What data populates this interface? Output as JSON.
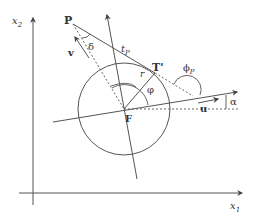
{
  "diagram": {
    "type": "geometry",
    "axes": {
      "x1": "x",
      "x1_sub": "1",
      "x2": "x",
      "x2_sub": "2"
    },
    "points": {
      "P": "P",
      "T": "T'",
      "F": "F"
    },
    "labels": {
      "delta": "δ",
      "v": "v",
      "tp": "t",
      "tp_sub": "P",
      "r": "r",
      "phi": "φ",
      "phi_p": "ϕ",
      "phi_p_sub": "P",
      "u": "u",
      "alpha": "α"
    },
    "colors": {
      "stroke": "#444444",
      "text": "#333333"
    }
  }
}
